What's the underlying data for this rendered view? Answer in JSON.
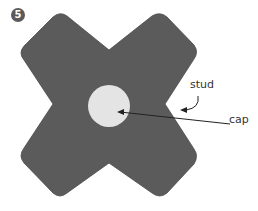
{
  "step": {
    "number": "5"
  },
  "diagram": {
    "shape_color": "#5b5b5b",
    "cap_color": "#e4e4e4",
    "labels": {
      "stud": "stud",
      "cap": "cap"
    }
  }
}
